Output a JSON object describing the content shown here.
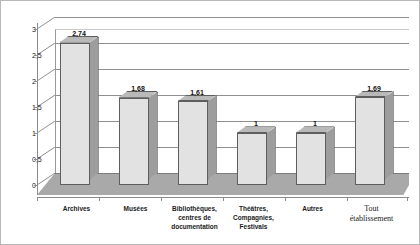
{
  "chart_data": {
    "type": "bar",
    "title": "",
    "subtitle": "",
    "xlabel": "",
    "ylabel": "",
    "ylim": [
      0,
      3
    ],
    "ytick_labels": [
      "0",
      "0,5",
      "1",
      "1,5",
      "2",
      "2,5",
      "3"
    ],
    "ytick_values": [
      0,
      0.5,
      1,
      1.5,
      2,
      2.5,
      3
    ],
    "grid": true,
    "legend": false,
    "legend_position": "none",
    "style": "3d-column",
    "categories": [
      "Archives",
      "Musées",
      "Bibliothèques, centres de documentation",
      "Théâtres, Compagnies, Festivals",
      "Autres",
      "Tout établissement"
    ],
    "category_lines": [
      [
        "Archives"
      ],
      [
        "Musées"
      ],
      [
        "Bibliothèques,",
        "centres de",
        "documentation"
      ],
      [
        "Théâtres,",
        "Compagnies,",
        "Festivals"
      ],
      [
        "Autres"
      ],
      [
        "Tout",
        "établissement"
      ]
    ],
    "values": [
      2.74,
      1.68,
      1.61,
      1,
      1,
      1.69
    ],
    "data_labels": [
      "2,74",
      "1,68",
      "1,61",
      "1",
      "1",
      "1,69"
    ],
    "colors": {
      "bar_front": "#e2e2e2",
      "bar_side": "#9d9d9d",
      "bar_top": "#b9b9b9",
      "bar_outline": "#5e5e5e",
      "floor": "#a9a9a9",
      "gridline": "#8f8f8f",
      "axis": "#8c8c8c",
      "border": "#b8b8b8",
      "text": "#1a1a1a",
      "background": "#ffffff"
    }
  }
}
